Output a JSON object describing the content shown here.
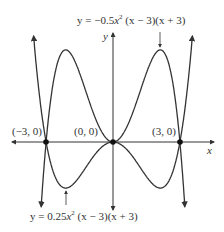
{
  "chart_data": {
    "type": "line",
    "title": "",
    "xlabel": "x",
    "ylabel": "y",
    "xlim": [
      -4.6,
      4.6
    ],
    "grid": false,
    "series": [
      {
        "name": "y = -0.5x^2 (x - 3)(x + 3)",
        "coef": -0.5,
        "label": "y = −0.5x² (x − 3)(x + 3)"
      },
      {
        "name": "y = 0.25x^2 (x - 3)(x + 3)",
        "coef": 0.25,
        "label": "y = 0.25x² (x − 3)(x + 3)"
      }
    ],
    "points": [
      {
        "x": -3,
        "y": 0,
        "label": "(−3, 0)"
      },
      {
        "x": 0,
        "y": 0,
        "label": "(0, 0)"
      },
      {
        "x": 3,
        "y": 0,
        "label": "(3, 0)"
      }
    ],
    "annotations": [
      {
        "text": "y = −0.5x² (x − 3)(x + 3)",
        "points_to": [
          2.12,
          10.125
        ]
      },
      {
        "text": "y = 0.25x² (x − 3)(x + 3)",
        "points_to": [
          -2.12,
          -5.06
        ]
      }
    ]
  },
  "labels": {
    "x_axis": "x",
    "y_axis": "y",
    "top_eq_prefix": "y = −0.5",
    "top_eq_suffix": " (x − 3)(x + 3)",
    "bottom_eq_prefix": "y = 0.25",
    "bottom_eq_suffix": " (x − 3)(x + 3)",
    "pt_neg3": "(−3, 0)",
    "pt_0": "(0, 0)",
    "pt_3": "(3, 0)"
  },
  "colors": {
    "curve": "#333333",
    "axis": "#333333"
  }
}
